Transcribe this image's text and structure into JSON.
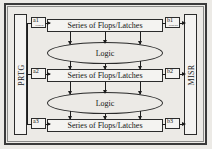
{
  "diagram": {
    "colors": {
      "background": "#eceae6",
      "frame": "#3a3a3a",
      "line": "#1d1d1d",
      "block_fill": "#f4f3f1",
      "text": "#131313"
    },
    "generator": {
      "label": "PRTG"
    },
    "compactor": {
      "label": "MISR"
    },
    "flop_rows": [
      {
        "label": "Series of Flops/Latches"
      },
      {
        "label": "Series of Flops/Latches"
      },
      {
        "label": "Series of Flops/Latches"
      }
    ],
    "logic_blocks": [
      {
        "label": "Logic"
      },
      {
        "label": "Logic"
      }
    ],
    "scan_in_taps": [
      {
        "id": "a1",
        "sub": "scan in"
      },
      {
        "id": "a2",
        "sub": ""
      },
      {
        "id": "a3",
        "sub": ""
      }
    ],
    "scan_out_taps": [
      {
        "id": "b1",
        "sub": "scan out"
      },
      {
        "id": "b2",
        "sub": ""
      },
      {
        "id": "b3",
        "sub": ""
      }
    ]
  }
}
